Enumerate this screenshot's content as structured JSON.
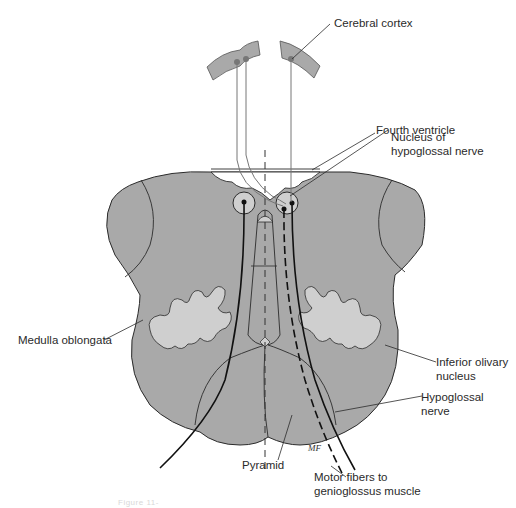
{
  "figure": {
    "caption": "Figure 11-",
    "colors": {
      "tissue": "#a9a9a9",
      "light_tissue": "#cfcfcf",
      "outline": "#2b2b2b",
      "pathway": "#111111",
      "background": "#ffffff"
    },
    "labels": {
      "cerebral_cortex": "Cerebral cortex",
      "fourth_ventricle": "Fourth ventricle",
      "nucleus_line1": "Nucleus of",
      "nucleus_line2": "hypoglossal nerve",
      "medulla": "Medulla oblongata",
      "olivary_line1": "Inferior olivary",
      "olivary_line2": "nucleus",
      "hypoglossal_line1": "Hypoglossal",
      "hypoglossal_line2": "nerve",
      "pyramid": "Pyramid",
      "motor_line1": "Motor fibers to",
      "motor_line2": "genioglossus muscle",
      "signature": "MF"
    }
  }
}
